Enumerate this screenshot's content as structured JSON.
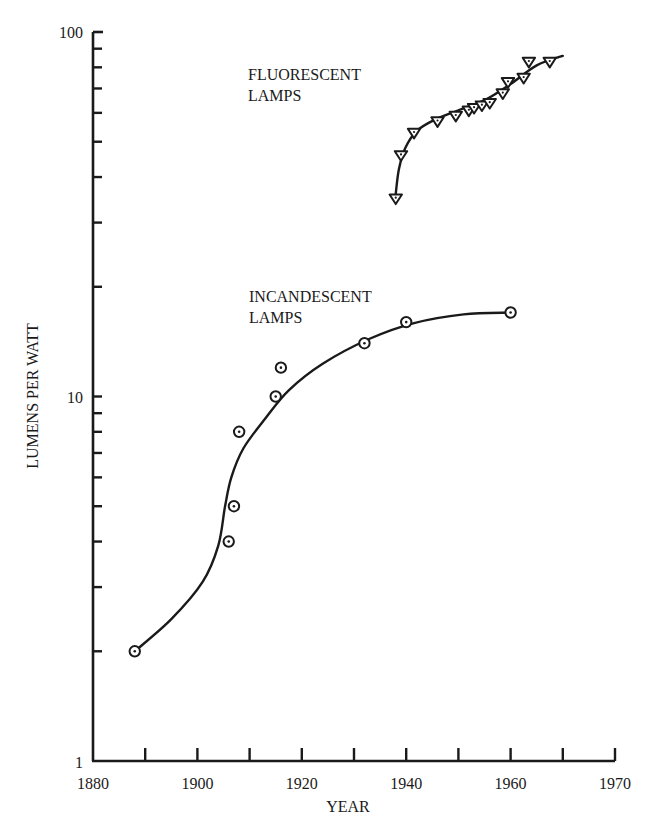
{
  "chart_data": {
    "type": "scatter",
    "title": "",
    "xlabel": "YEAR",
    "ylabel": "LUMENS PER WATT",
    "yscale": "log",
    "ylim": [
      1,
      100
    ],
    "xlim": [
      1880,
      1970
    ],
    "grid": false,
    "x_tick_labels": [
      {
        "value": 1880,
        "label": "1880"
      },
      {
        "value": 1900,
        "label": "1900"
      },
      {
        "value": 1920,
        "label": "1920"
      },
      {
        "value": 1940,
        "label": "1940"
      },
      {
        "value": 1960,
        "label": "1960"
      },
      {
        "value": 1980,
        "label": "1970"
      }
    ],
    "x_ticks": [
      1880,
      1890,
      1900,
      1910,
      1920,
      1930,
      1940,
      1950,
      1960,
      1970,
      1980
    ],
    "y_tick_labels": [
      {
        "value": 1,
        "label": "1"
      },
      {
        "value": 10,
        "label": "10"
      },
      {
        "value": 100,
        "label": "100"
      }
    ],
    "y_minor_ticks": [
      2,
      3,
      4,
      5,
      6,
      7,
      8,
      9,
      20,
      30,
      40,
      50,
      60,
      70,
      80,
      90
    ],
    "series": [
      {
        "name": "INCANDESCENT LAMPS",
        "label_lines": [
          "INCANDESCENT",
          "LAMPS"
        ],
        "marker": "circle-dot",
        "points": [
          {
            "x": 1888,
            "y": 2.0
          },
          {
            "x": 1906,
            "y": 4.0
          },
          {
            "x": 1907,
            "y": 5.0
          },
          {
            "x": 1908,
            "y": 8.0
          },
          {
            "x": 1915,
            "y": 10.0
          },
          {
            "x": 1916,
            "y": 12.0
          },
          {
            "x": 1932,
            "y": 14.0
          },
          {
            "x": 1940,
            "y": 16.0
          },
          {
            "x": 1960,
            "y": 17.0
          }
        ],
        "curve": [
          {
            "x": 1888,
            "y": 2.0
          },
          {
            "x": 1895,
            "y": 2.45
          },
          {
            "x": 1901,
            "y": 3.1
          },
          {
            "x": 1904,
            "y": 3.9
          },
          {
            "x": 1905.3,
            "y": 5.0
          },
          {
            "x": 1906.5,
            "y": 6.0
          },
          {
            "x": 1908.8,
            "y": 7.2
          },
          {
            "x": 1913,
            "y": 8.7
          },
          {
            "x": 1917.5,
            "y": 10.4
          },
          {
            "x": 1924,
            "y": 12.3
          },
          {
            "x": 1933,
            "y": 14.4
          },
          {
            "x": 1941.5,
            "y": 15.9
          },
          {
            "x": 1951,
            "y": 16.8
          },
          {
            "x": 1960,
            "y": 17.0
          }
        ]
      },
      {
        "name": "FLUORESCENT LAMPS",
        "label_lines": [
          "FLUORESCENT",
          "LAMPS"
        ],
        "marker": "triangle-down",
        "points": [
          {
            "x": 1938,
            "y": 35
          },
          {
            "x": 1939,
            "y": 46
          },
          {
            "x": 1941.5,
            "y": 53
          },
          {
            "x": 1946,
            "y": 57
          },
          {
            "x": 1949.5,
            "y": 59
          },
          {
            "x": 1952,
            "y": 61
          },
          {
            "x": 1953,
            "y": 62
          },
          {
            "x": 1954.5,
            "y": 63
          },
          {
            "x": 1956,
            "y": 64
          },
          {
            "x": 1958.5,
            "y": 68
          },
          {
            "x": 1959.5,
            "y": 73
          },
          {
            "x": 1962.5,
            "y": 75
          },
          {
            "x": 1963.5,
            "y": 83
          },
          {
            "x": 1967.5,
            "y": 83
          }
        ],
        "curve": [
          {
            "x": 1938,
            "y": 36
          },
          {
            "x": 1938.6,
            "y": 42
          },
          {
            "x": 1939.8,
            "y": 48
          },
          {
            "x": 1942,
            "y": 53.5
          },
          {
            "x": 1945.5,
            "y": 57.5
          },
          {
            "x": 1950,
            "y": 61
          },
          {
            "x": 1955,
            "y": 65
          },
          {
            "x": 1960,
            "y": 72
          },
          {
            "x": 1965,
            "y": 81
          },
          {
            "x": 1970,
            "y": 86
          }
        ]
      }
    ]
  }
}
